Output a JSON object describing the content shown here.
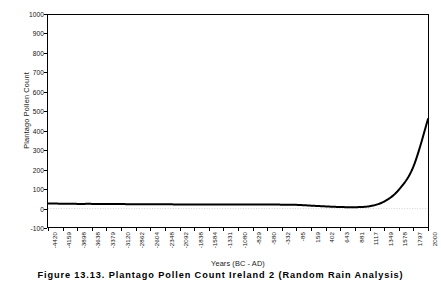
{
  "chart_data": {
    "type": "line",
    "title": "",
    "xlabel": "Years (BC - AD)",
    "ylabel": "Plantago Pollen Count",
    "ylim": [
      -100,
      1000
    ],
    "ytick_values": [
      1000,
      900,
      800,
      700,
      600,
      500,
      400,
      300,
      200,
      100,
      0,
      -100
    ],
    "ytick_labels": [
      "1000",
      "900",
      "800",
      "700",
      "600",
      "500",
      "400",
      "300",
      "200",
      "100",
      "0",
      "-100"
    ],
    "grid": false,
    "legend": "none",
    "line_color": "#000000",
    "categories": [
      "-4420",
      "-4159",
      "-3898",
      "-3638",
      "-3379",
      "-3120",
      "-2862",
      "-2604",
      "-2348",
      "-2092",
      "-1838",
      "-1584",
      "-1331",
      "-1080",
      "-829",
      "-580",
      "-332",
      "-85",
      "159",
      "402",
      "643",
      "881",
      "1117",
      "1349",
      "1578",
      "1797",
      "2000"
    ],
    "series": [
      {
        "name": "Plantago Pollen Count",
        "values": [
          26,
          25,
          24,
          24,
          23,
          23,
          22,
          22,
          22,
          21,
          21,
          21,
          21,
          21,
          21,
          21,
          20,
          19,
          15,
          11,
          8,
          7,
          12,
          36,
          96,
          215,
          460
        ]
      }
    ]
  },
  "caption": {
    "text": "Figure 13.13.  Plantago Pollen Count Ireland 2 (Random Rain Analysis)"
  }
}
